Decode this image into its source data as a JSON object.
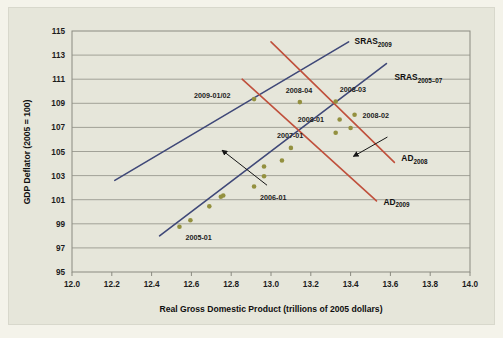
{
  "figure": {
    "background": "#f4f3ea",
    "panel_background": "#e6e6da"
  },
  "chart_data": {
    "type": "scatter",
    "title": "",
    "xlabel": "Real Gross Domestic Product (trillions of 2005 dollars)",
    "ylabel": "GDP Deflator (2005 = 100)",
    "xlim": [
      12.0,
      14.0
    ],
    "ylim": [
      95,
      115
    ],
    "xticks": [
      "12.0",
      "12.2",
      "12.4",
      "12.6",
      "12.8",
      "13.0",
      "13.2",
      "13.4",
      "13.6",
      "13.8",
      "14.0"
    ],
    "yticks": [
      "95",
      "97",
      "99",
      "101",
      "103",
      "105",
      "107",
      "109",
      "111",
      "113",
      "115"
    ],
    "grid": "horizontal",
    "legend": "none",
    "point_color": "#93903f",
    "points": [
      {
        "x": 12.54,
        "y": 98.75,
        "label": "2005-01",
        "label_dx": 6,
        "label_dy": 13
      },
      {
        "x": 12.595,
        "y": 99.3,
        "label": ""
      },
      {
        "x": 12.69,
        "y": 100.45,
        "label": ""
      },
      {
        "x": 12.748,
        "y": 101.25,
        "label": ""
      },
      {
        "x": 12.76,
        "y": 101.35,
        "label": ""
      },
      {
        "x": 12.915,
        "y": 102.1,
        "label": "2006-01",
        "label_dx": 6,
        "label_dy": 14
      },
      {
        "x": 12.965,
        "y": 102.95,
        "label": ""
      },
      {
        "x": 12.965,
        "y": 103.75,
        "label": ""
      },
      {
        "x": 13.055,
        "y": 104.25,
        "label": ""
      },
      {
        "x": 13.1,
        "y": 105.3,
        "label": "2007-01",
        "label_dx": -14,
        "label_dy": -10
      },
      {
        "x": 13.325,
        "y": 106.55,
        "label": ""
      },
      {
        "x": 13.345,
        "y": 107.65,
        "label": "2008-01",
        "label_dx": -42,
        "label_dy": 2
      },
      {
        "x": 13.4,
        "y": 106.95,
        "label": ""
      },
      {
        "x": 13.42,
        "y": 108.05,
        "label": "2008-02",
        "label_dx": 8,
        "label_dy": 3
      },
      {
        "x": 13.325,
        "y": 109.15,
        "label": "2008-03",
        "label_dx": 4,
        "label_dy": -9
      },
      {
        "x": 13.145,
        "y": 109.1,
        "label": "2008-04",
        "label_dx": -14,
        "label_dy": -9
      },
      {
        "x": 12.915,
        "y": 109.35,
        "label": "2009-01/02",
        "label_dx": -60,
        "label_dy": -1
      }
    ],
    "curves": [
      {
        "name": "SRAS_2005-07",
        "base": "SRAS",
        "sub": "2005–07",
        "color": "#3f4878",
        "x1": 12.44,
        "y1": 98.0,
        "x2": 13.58,
        "y2": 112.3,
        "label_x": 13.62,
        "label_y": 110.9
      },
      {
        "name": "SRAS_2009",
        "base": "SRAS",
        "sub": "2009",
        "color": "#3f4878",
        "x1": 12.215,
        "y1": 102.6,
        "x2": 13.39,
        "y2": 114.1,
        "label_x": 13.42,
        "label_y": 113.9
      },
      {
        "name": "AD_2008",
        "base": "AD",
        "sub": "2008",
        "color": "#c0503c",
        "x1": 13.0,
        "y1": 114.1,
        "x2": 13.62,
        "y2": 104.1,
        "label_x": 13.655,
        "label_y": 104.2
      },
      {
        "name": "AD_2009",
        "base": "AD",
        "sub": "2009",
        "color": "#c0503c",
        "x1": 12.855,
        "y1": 111.0,
        "x2": 13.53,
        "y2": 100.9,
        "label_x": 13.565,
        "label_y": 100.6
      }
    ],
    "arrows": [
      {
        "name": "sras-shift-arrow",
        "x1": 12.98,
        "y1": 102.2,
        "x2": 12.755,
        "y2": 105.1,
        "color": "#151515"
      },
      {
        "name": "ad-shift-arrow",
        "x1": 13.585,
        "y1": 106.2,
        "x2": 13.415,
        "y2": 104.6,
        "color": "#151515"
      }
    ]
  }
}
